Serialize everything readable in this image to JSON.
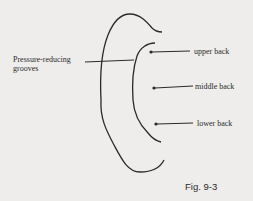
{
  "figure": {
    "caption": "Fig. 9-3",
    "callouts": [
      {
        "label_line1": "Pressure-reducing",
        "label_line2": "grooves"
      },
      {
        "label": "upper back"
      },
      {
        "label": "middle back"
      },
      {
        "label": "lower back"
      }
    ],
    "colors": {
      "background": "#eeedeb",
      "ink": "#2a2a2a"
    }
  }
}
